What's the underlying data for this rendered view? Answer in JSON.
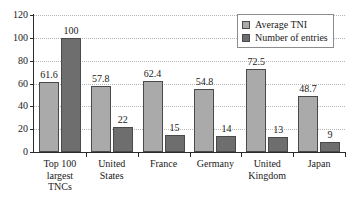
{
  "chart_data": {
    "type": "bar",
    "title": "",
    "subtitle": "",
    "xlabel": "",
    "ylabel": "",
    "ylim": [
      0,
      120
    ],
    "yticks": [
      0,
      20,
      40,
      60,
      80,
      100,
      120
    ],
    "grid": true,
    "legend_position": "top-right",
    "categories": [
      "Top 100\nlargest\nTNCs",
      "United\nStates",
      "France",
      "Germany",
      "United\nKingdom",
      "Japan"
    ],
    "series": [
      {
        "name": "Average TNI",
        "color": "#aaaaaa",
        "values": [
          61.6,
          57.8,
          62.4,
          54.8,
          72.5,
          48.7
        ],
        "labels": [
          "61.6",
          "57.8",
          "62.4",
          "54.8",
          "72.5",
          "48.7"
        ]
      },
      {
        "name": "Number of entries",
        "color": "#6e6e6e",
        "values": [
          100,
          22,
          15,
          14,
          13,
          9
        ],
        "labels": [
          "100",
          "22",
          "15",
          "14",
          "13",
          "9"
        ]
      }
    ]
  },
  "legend": {
    "items": [
      {
        "label": "Average TNI",
        "swatch": "#aaaaaa"
      },
      {
        "label": "Number of entries",
        "swatch": "#6e6e6e"
      }
    ]
  },
  "axis": {
    "y_tick_labels": [
      "0",
      "20",
      "40",
      "60",
      "80",
      "100",
      "120"
    ]
  }
}
